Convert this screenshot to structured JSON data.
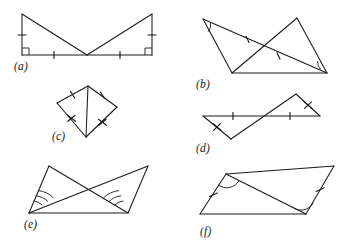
{
  "sheet": {
    "width": 346,
    "height": 247,
    "background_color": "#ffffff",
    "ink_color": "#1a1a1a",
    "description": "Six labelled geometry figures showing congruent-triangle markings"
  },
  "figures": [
    {
      "id": "a",
      "caption": "(a)",
      "caption_pos": {
        "x": 14,
        "y": 70
      },
      "shape": "two right triangles meeting at a common apex on the base",
      "vertices": {
        "top_left": {
          "x": 22,
          "y": 14
        },
        "top_right": {
          "x": 152,
          "y": 14
        },
        "bottom_left": {
          "x": 22,
          "y": 55
        },
        "bottom_right": {
          "x": 152,
          "y": 55
        },
        "apex": {
          "x": 87,
          "y": 55
        }
      },
      "segments": [
        {
          "name": "left-leg",
          "from": "bottom_left",
          "to": "top_left"
        },
        {
          "name": "right-leg",
          "from": "bottom_right",
          "to": "top_right"
        },
        {
          "name": "base",
          "from": "bottom_left",
          "to": "bottom_right"
        },
        {
          "name": "left-hypotenuse",
          "from": "top_left",
          "to": "apex"
        },
        {
          "name": "right-hypotenuse",
          "from": "top_right",
          "to": "apex"
        }
      ],
      "marks": {
        "right_angle_squares": [
          "bottom_left",
          "bottom_right"
        ],
        "single_ticks": [
          "left-leg",
          "right-leg",
          "base-left-half",
          "base-right-half"
        ]
      }
    },
    {
      "id": "b",
      "caption": "(b)",
      "caption_pos": {
        "x": 196,
        "y": 88
      },
      "shape": "two crossing triangles forming a bowtie",
      "vertices": {
        "left": {
          "x": 203,
          "y": 19
        },
        "left_low": {
          "x": 232,
          "y": 73
        },
        "right_top": {
          "x": 297,
          "y": 18
        },
        "right": {
          "x": 327,
          "y": 73
        }
      },
      "segments": [
        {
          "name": "left-side",
          "from": "left",
          "to": "left_low"
        },
        {
          "name": "left-diagonal",
          "from": "left",
          "to": "right"
        },
        {
          "name": "left-base",
          "from": "left_low",
          "to": "right"
        },
        {
          "name": "right-side",
          "from": "right_top",
          "to": "right"
        },
        {
          "name": "right-diagonal",
          "from": "right_top",
          "to": "left_low"
        }
      ],
      "marks": {
        "angle_arcs": [
          "left",
          "right"
        ],
        "single_ticks": [
          "left-diagonal",
          "right-diagonal"
        ]
      }
    },
    {
      "id": "c",
      "caption": "(c)",
      "caption_pos": {
        "x": 52,
        "y": 140
      },
      "shape": "kite with vertical diagonal drawn",
      "vertices": {
        "top": {
          "x": 88,
          "y": 86
        },
        "left": {
          "x": 57,
          "y": 103
        },
        "right": {
          "x": 117,
          "y": 107
        },
        "bottom": {
          "x": 86,
          "y": 137
        }
      },
      "segments": [
        {
          "name": "upper-left",
          "from": "top",
          "to": "left"
        },
        {
          "name": "upper-right",
          "from": "top",
          "to": "right"
        },
        {
          "name": "lower-left",
          "from": "left",
          "to": "bottom"
        },
        {
          "name": "lower-right",
          "from": "right",
          "to": "bottom"
        },
        {
          "name": "vertical-diagonal",
          "from": "top",
          "to": "bottom"
        }
      ],
      "marks": {
        "single_ticks": [
          "upper-left",
          "upper-right"
        ],
        "cross_ticks": [
          "lower-left",
          "lower-right"
        ]
      }
    },
    {
      "id": "d",
      "caption": "(d)",
      "caption_pos": {
        "x": 196,
        "y": 152
      },
      "shape": "two crossing triangles sharing a horizontal transversal",
      "vertices": {
        "left": {
          "x": 203,
          "y": 116
        },
        "bottom": {
          "x": 231,
          "y": 139
        },
        "right": {
          "x": 320,
          "y": 116
        },
        "top": {
          "x": 296,
          "y": 94
        }
      },
      "segments": [
        {
          "name": "horizontal",
          "from": "left",
          "to": "right"
        },
        {
          "name": "left-slant",
          "from": "left",
          "to": "bottom"
        },
        {
          "name": "long-diagonal",
          "from": "bottom",
          "to": "top"
        },
        {
          "name": "right-slant",
          "from": "top",
          "to": "right"
        }
      ],
      "marks": {
        "single_ticks": [
          "horizontal-left-half",
          "horizontal-right-half"
        ],
        "cross_ticks": [
          "left-slant",
          "right-slant"
        ]
      }
    },
    {
      "id": "e",
      "caption": "(e)",
      "caption_pos": {
        "x": 24,
        "y": 228
      },
      "shape": "two triangles on a shared base with crossing cevians",
      "vertices": {
        "base_left": {
          "x": 29,
          "y": 213
        },
        "base_right": {
          "x": 128,
          "y": 213
        },
        "apex_left": {
          "x": 49,
          "y": 166
        },
        "apex_right": {
          "x": 148,
          "y": 166
        }
      },
      "segments": [
        {
          "name": "base",
          "from": "base_left",
          "to": "base_right"
        },
        {
          "name": "left-rise",
          "from": "base_left",
          "to": "apex_left"
        },
        {
          "name": "right-rise",
          "from": "base_right",
          "to": "apex_right"
        },
        {
          "name": "cross-a",
          "from": "base_left",
          "to": "apex_right"
        },
        {
          "name": "cross-b",
          "from": "base_right",
          "to": "apex_left"
        }
      ],
      "marks": {
        "hatched_angle_arcs": [
          "base_left",
          "base_right"
        ]
      }
    },
    {
      "id": "f",
      "caption": "(f)",
      "caption_pos": {
        "x": 200,
        "y": 235
      },
      "shape": "parallelogram with one diagonal drawn",
      "vertices": {
        "top_left": {
          "x": 226,
          "y": 174
        },
        "top_right": {
          "x": 334,
          "y": 166
        },
        "bottom_right": {
          "x": 306,
          "y": 214
        },
        "bottom_left": {
          "x": 200,
          "y": 214
        }
      },
      "segments": [
        {
          "name": "top",
          "from": "top_left",
          "to": "top_right"
        },
        {
          "name": "right-side",
          "from": "top_right",
          "to": "bottom_right"
        },
        {
          "name": "bottom",
          "from": "bottom_right",
          "to": "bottom_left"
        },
        {
          "name": "left-side",
          "from": "bottom_left",
          "to": "top_left"
        },
        {
          "name": "diagonal",
          "from": "top_left",
          "to": "bottom_right"
        }
      ],
      "marks": {
        "angle_arcs": [
          "top_left",
          "bottom_right"
        ],
        "single_ticks": [
          "left-side",
          "right-side"
        ]
      }
    }
  ]
}
